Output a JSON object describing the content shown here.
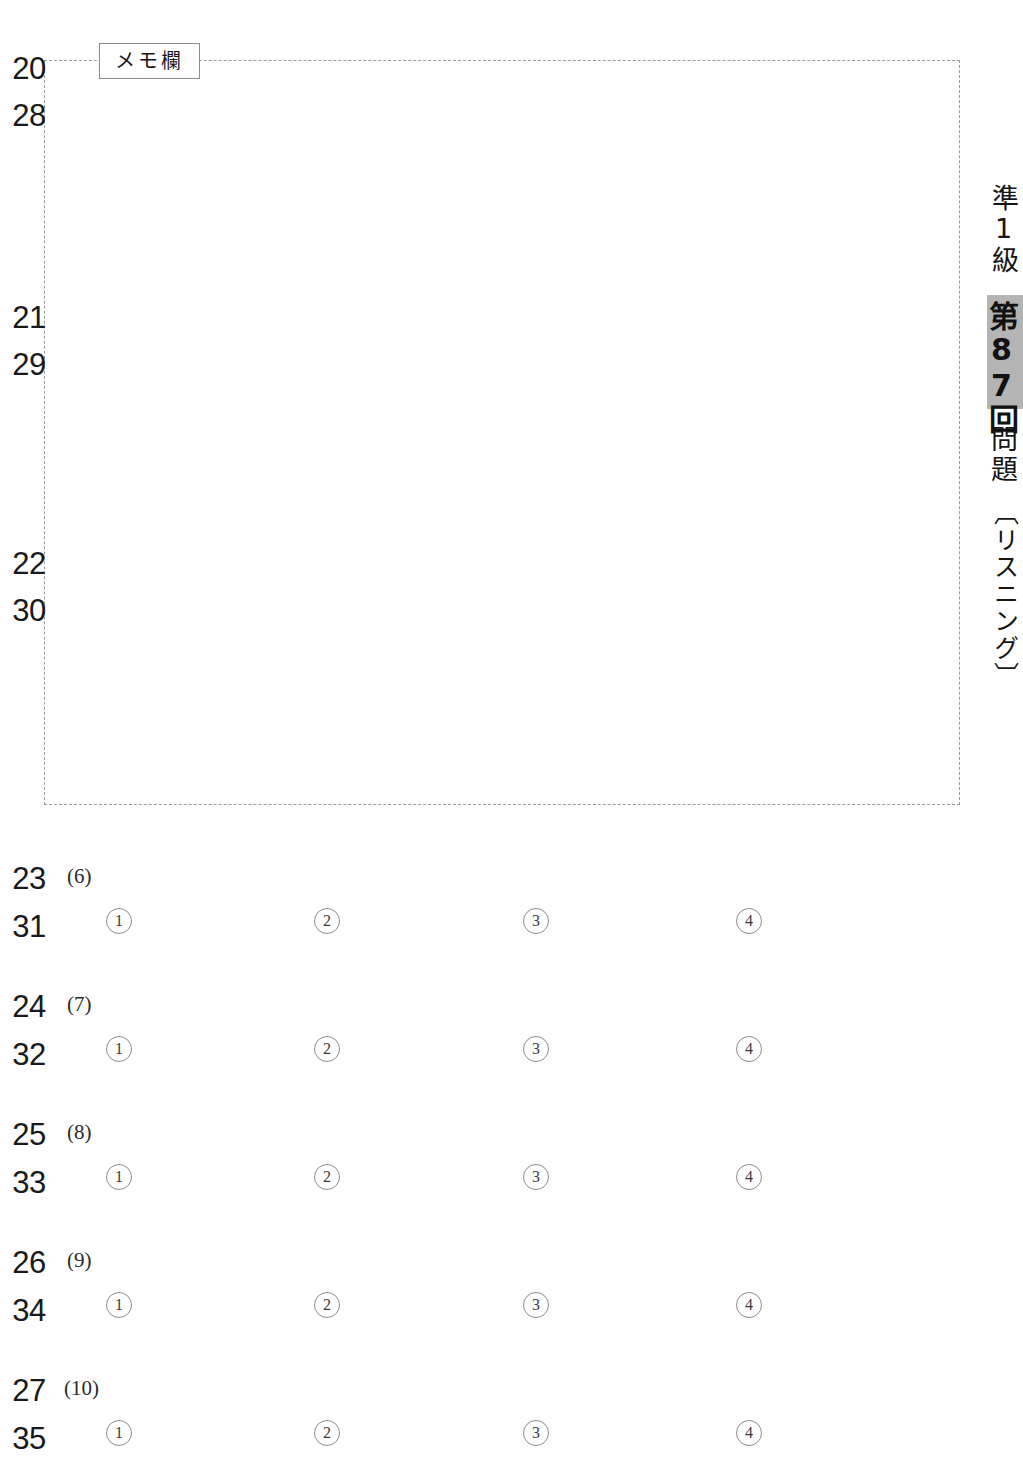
{
  "memo": {
    "label": "メモ欄"
  },
  "margin_right": {
    "grade": "準1級",
    "session": "第87回",
    "questions": "問題",
    "section": "〔リスニング〕"
  },
  "markers": [
    {
      "top": "20",
      "bottom": "28"
    },
    {
      "top": "21",
      "bottom": "29"
    },
    {
      "top": "22",
      "bottom": "30"
    },
    {
      "top": "23",
      "bottom": "31"
    },
    {
      "top": "24",
      "bottom": "32"
    },
    {
      "top": "25",
      "bottom": "33"
    },
    {
      "top": "26",
      "bottom": "34"
    },
    {
      "top": "27",
      "bottom": "35"
    }
  ],
  "questions": [
    {
      "number": "(6)",
      "marker_q": "23",
      "marker_a": "31",
      "options": [
        "1",
        "2",
        "3",
        "4"
      ]
    },
    {
      "number": "(7)",
      "marker_q": "24",
      "marker_a": "32",
      "options": [
        "1",
        "2",
        "3",
        "4"
      ]
    },
    {
      "number": "(8)",
      "marker_q": "25",
      "marker_a": "33",
      "options": [
        "1",
        "2",
        "3",
        "4"
      ]
    },
    {
      "number": "(9)",
      "marker_q": "26",
      "marker_a": "34",
      "options": [
        "1",
        "2",
        "3",
        "4"
      ]
    },
    {
      "number": "(10)",
      "marker_q": "27",
      "marker_a": "35",
      "options": [
        "1",
        "2",
        "3",
        "4"
      ]
    }
  ]
}
